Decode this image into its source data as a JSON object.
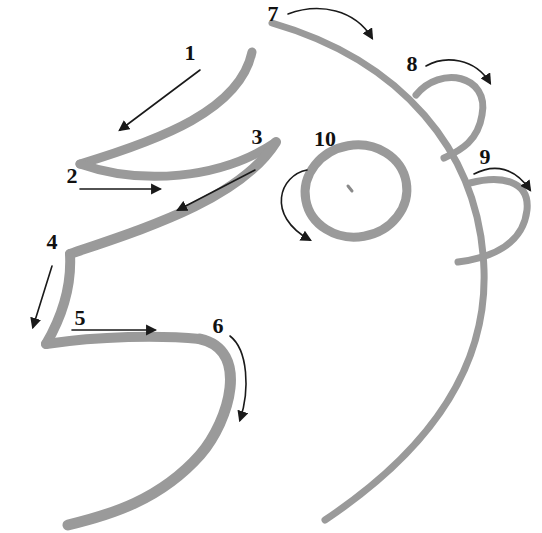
{
  "diagram": {
    "type": "step-by-step drawing guide",
    "stroke_color": "#9a9a9a",
    "arrow_color": "#1a1a1a",
    "background": "#ffffff",
    "steps": [
      {
        "number": "1",
        "label_x": 190,
        "label_y": 53
      },
      {
        "number": "2",
        "label_x": 72,
        "label_y": 176
      },
      {
        "number": "3",
        "label_x": 257,
        "label_y": 137
      },
      {
        "number": "4",
        "label_x": 52,
        "label_y": 242
      },
      {
        "number": "5",
        "label_x": 80,
        "label_y": 318
      },
      {
        "number": "6",
        "label_x": 218,
        "label_y": 326
      },
      {
        "number": "7",
        "label_x": 273,
        "label_y": 14
      },
      {
        "number": "8",
        "label_x": 412,
        "label_y": 64
      },
      {
        "number": "9",
        "label_x": 485,
        "label_y": 157
      },
      {
        "number": "10",
        "label_x": 325,
        "label_y": 139
      }
    ]
  }
}
